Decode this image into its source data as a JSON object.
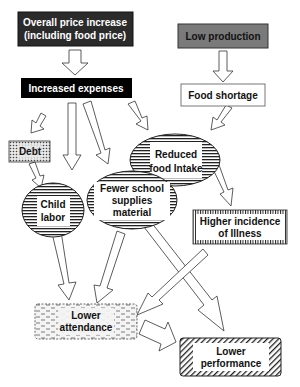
{
  "diagram": {
    "nodes": {
      "price_increase": {
        "line1": "Overall price increase",
        "line2": "(including food price)",
        "style": "dark-fill",
        "fill": "#2b2b2b",
        "text_color": "#ffffff"
      },
      "low_production": {
        "line1": "Low production",
        "style": "gray-fill",
        "fill": "#7a7a7a",
        "text_color": "#111111"
      },
      "increased_expenses": {
        "line1": "Increased expenses",
        "style": "black-fill",
        "fill": "#000000",
        "text_color": "#ffffff"
      },
      "food_shortage": {
        "line1": "Food shortage",
        "style": "outline"
      },
      "debt": {
        "line1": "Debt",
        "style": "dotted-fill"
      },
      "reduced_food_intake": {
        "line1": "Reduced",
        "line2": "food Intake",
        "style": "horizontal-stripe-ellipse"
      },
      "child_labor": {
        "line1": "Child",
        "line2": "labor",
        "style": "horizontal-stripe-ellipse"
      },
      "fewer_school_supplies": {
        "line1": "Fewer school",
        "line2": "supplies",
        "line3": "material",
        "style": "horizontal-stripe-ellipse"
      },
      "higher_illness": {
        "line1": "Higher incidence",
        "line2": "of Illness",
        "style": "vertical-tick-border"
      },
      "lower_attendance": {
        "line1": "Lower",
        "line2": "attendance",
        "style": "dashed-fill"
      },
      "lower_performance": {
        "line1": "Lower",
        "line2": "performance",
        "style": "diagonal-hatch-border"
      }
    },
    "edges": [
      {
        "from": "Overall price increase",
        "to": "Increased expenses"
      },
      {
        "from": "Low production",
        "to": "Food shortage"
      },
      {
        "from": "Increased expenses",
        "to": "Debt"
      },
      {
        "from": "Increased expenses",
        "to": "Child labor"
      },
      {
        "from": "Increased expenses",
        "to": "Fewer school supplies material"
      },
      {
        "from": "Increased expenses",
        "to": "Reduced food Intake"
      },
      {
        "from": "Food shortage",
        "to": "Reduced food Intake"
      },
      {
        "from": "Debt",
        "to": "Child labor"
      },
      {
        "from": "Reduced food Intake",
        "to": "Higher incidence of Illness"
      },
      {
        "from": "Child labor",
        "to": "Lower attendance"
      },
      {
        "from": "Fewer school supplies material",
        "to": "Lower attendance"
      },
      {
        "from": "Fewer school supplies material",
        "to": "Lower performance"
      },
      {
        "from": "Higher incidence of Illness",
        "to": "Lower attendance"
      },
      {
        "from": "Lower attendance",
        "to": "Lower performance"
      }
    ]
  }
}
